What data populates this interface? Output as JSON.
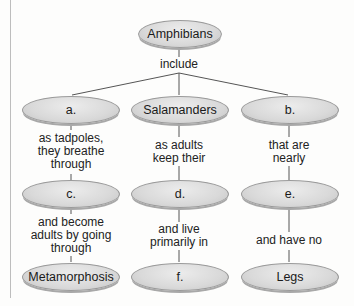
{
  "diagram": {
    "type": "concept_map",
    "root": {
      "label": "Amphibians"
    },
    "root_link": "include",
    "columns": [
      {
        "nodes": [
          "a.",
          "c.",
          "Metamorphosis"
        ],
        "links": [
          "as tadpoles, they breathe through",
          "and become adults by going through"
        ]
      },
      {
        "nodes": [
          "Salamanders",
          "d.",
          "f."
        ],
        "links": [
          "as adults keep their",
          "and live primarily in"
        ]
      },
      {
        "nodes": [
          "b.",
          "e.",
          "Legs"
        ],
        "links": [
          "that are nearly",
          "and have no"
        ]
      }
    ]
  },
  "text": {
    "root": "Amphibians",
    "include": "include",
    "col0": {
      "n0": "a.",
      "n1": "c.",
      "n2": "Metamorphosis",
      "l0a": "as tadpoles,",
      "l0b": "they breathe",
      "l0c": "through",
      "l1a": "and become",
      "l1b": "adults by going",
      "l1c": "through"
    },
    "col1": {
      "n0": "Salamanders",
      "n1": "d.",
      "n2": "f.",
      "l0a": "as adults",
      "l0b": "keep their",
      "l1a": "and live",
      "l1b": "primarily in"
    },
    "col2": {
      "n0": "b.",
      "n1": "e.",
      "n2": "Legs",
      "l0a": "that are",
      "l0b": "nearly",
      "l1a": "and have no"
    }
  },
  "colors": {
    "node_fill": "#d9d9d9",
    "node_border": "#9a9a9a",
    "line": "#555555"
  }
}
